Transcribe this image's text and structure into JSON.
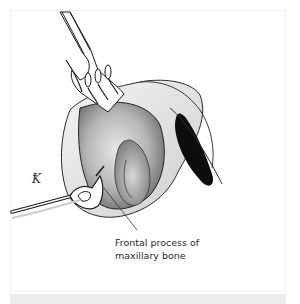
{
  "figure": {
    "label_lines": [
      "Frontal process of",
      "maxillary bone"
    ],
    "signature_glyph": "Ꝁ",
    "colors": {
      "frame_border": "#f0f0f0",
      "caption_bar": "#ececec",
      "ink": "#1a1a1a",
      "shade": "#888888"
    }
  }
}
